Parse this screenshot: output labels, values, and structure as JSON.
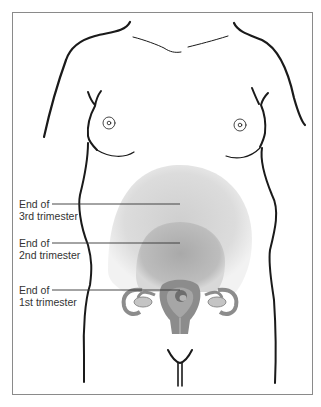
{
  "figure": {
    "labels": [
      {
        "line1": "End of",
        "line2": "3rd trimester"
      },
      {
        "line1": "End of",
        "line2": "2nd trimester"
      },
      {
        "line1": "End of",
        "line2": "1st trimester"
      }
    ],
    "colors": {
      "third_trimester_fill": "#d9d9d9",
      "second_trimester_fill": "#bdbdbd",
      "uterus_fill": "#8c8c8c",
      "outline": "#1a1a1a",
      "frame": "#8a8a8a"
    }
  }
}
